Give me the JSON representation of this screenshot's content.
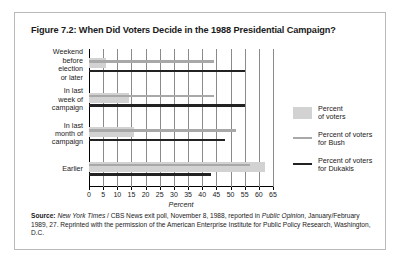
{
  "figure": {
    "title": "Figure 7.2: When Did Voters Decide in the 1988 Presidential Campaign?"
  },
  "source": {
    "label": "Source:",
    "italic_1": "New York Times",
    "text_1": " / CBS News exit poll, November 8, 1988, reported in ",
    "italic_2": "Public Opinion",
    "text_2": ", January/February 1989, 27. Reprinted with the permission of the American Enterprise Institute for Public Policy Research, Washington, D.C."
  },
  "legend": {
    "items": [
      {
        "label": "Percent\nof voters",
        "marker": "swatch",
        "color": "#d2d2d2"
      },
      {
        "label": "Percent of voters\nfor Bush",
        "marker": "line",
        "color": "#a8a8a8"
      },
      {
        "label": "Percent of voters\nfor Dukakis",
        "marker": "line",
        "color": "#222222"
      }
    ]
  },
  "chart_data": {
    "type": "bar",
    "orientation": "horizontal",
    "title": "Figure 7.2: When Did Voters Decide in the 1988 Presidential Campaign?",
    "xlabel": "Percent",
    "ylabel": "",
    "xlim": [
      0,
      65
    ],
    "xticks": [
      0,
      5,
      10,
      15,
      20,
      25,
      30,
      35,
      40,
      45,
      50,
      55,
      60,
      65
    ],
    "grid": true,
    "legend_position": "right",
    "categories": [
      "Weekend before election or later",
      "In last week of campaign",
      "In last month of campaign",
      "Earlier"
    ],
    "category_labels_multiline": [
      "Weekend\nbefore\nelection\nor later",
      "In last\nweek of\ncampaign",
      "In last\nmonth of\ncampaign",
      "Earlier"
    ],
    "series": [
      {
        "name": "Percent of voters",
        "color": "#d2d2d2",
        "style": "bar",
        "values": [
          6,
          14,
          16,
          62
        ]
      },
      {
        "name": "Percent of voters for Bush",
        "color": "#a8a8a8",
        "style": "line",
        "values": [
          44,
          44,
          52,
          57
        ]
      },
      {
        "name": "Percent of voters for Dukakis",
        "color": "#222222",
        "style": "line",
        "values": [
          55,
          55,
          48,
          43
        ]
      }
    ]
  }
}
